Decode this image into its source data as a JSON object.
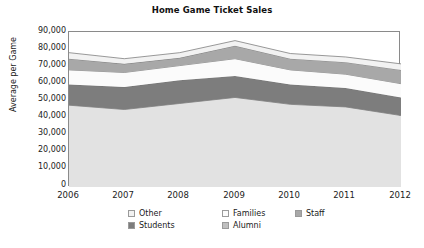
{
  "chart_data": {
    "type": "area",
    "stacked": true,
    "title": "Home Game Ticket Sales",
    "xlabel": "",
    "ylabel": "Average per Game",
    "x": [
      2006,
      2007,
      2008,
      2009,
      2010,
      2011,
      2012
    ],
    "categories": [
      "2006",
      "2007",
      "2008",
      "2009",
      "2010",
      "2011",
      "2012"
    ],
    "ylim": [
      0,
      90000
    ],
    "ytick_labels": [
      "90,000",
      "80,000",
      "70,000",
      "60,000",
      "50,000",
      "40,000",
      "30,000",
      "20,000",
      "10,000",
      "0"
    ],
    "ytick_values": [
      90000,
      80000,
      70000,
      60000,
      50000,
      40000,
      30000,
      20000,
      10000,
      0
    ],
    "grid": false,
    "legend_position": "bottom",
    "stack_order_bottom_to_top": [
      "Alumni",
      "Students",
      "Families",
      "Staff",
      "Other"
    ],
    "series": [
      {
        "name": "Alumni",
        "color": "#e2e2e2",
        "values": [
          47500,
          45000,
          48500,
          52000,
          48000,
          46500,
          41500
        ]
      },
      {
        "name": "Students",
        "color": "#7d7d7d",
        "values": [
          12000,
          13000,
          13500,
          12500,
          11500,
          11000,
          10500
        ]
      },
      {
        "name": "Families",
        "color": "#fbfbfb",
        "values": [
          8500,
          8500,
          8500,
          10000,
          8500,
          8000,
          8000
        ]
      },
      {
        "name": "Staff",
        "color": "#a8a8a8",
        "values": [
          6500,
          5000,
          4500,
          7500,
          6500,
          7000,
          8000
        ]
      },
      {
        "name": "Other",
        "color": "#f2f2f2",
        "values": [
          3500,
          3000,
          3000,
          3000,
          3000,
          3000,
          3500
        ]
      }
    ],
    "cumulative_tops": {
      "Alumni": [
        47500,
        45000,
        48500,
        52000,
        48000,
        46500,
        41500
      ],
      "Students": [
        59500,
        58000,
        62000,
        64500,
        59500,
        57500,
        52000
      ],
      "Families": [
        68000,
        66500,
        70500,
        74500,
        68000,
        65500,
        60000
      ],
      "Staff": [
        74500,
        71500,
        75000,
        82000,
        74500,
        72500,
        68000
      ],
      "Other": [
        78000,
        74500,
        78000,
        85000,
        77500,
        75500,
        71500
      ]
    }
  },
  "legend": {
    "row1": [
      {
        "label": "Other",
        "color": "#f2f2f2"
      },
      {
        "label": "Families",
        "color": "#fbfbfb"
      },
      {
        "label": "Staff",
        "color": "#a8a8a8"
      }
    ],
    "row2": [
      {
        "label": "Students",
        "color": "#7d7d7d"
      },
      {
        "label": "Alumni",
        "color": "#bfbfbf"
      }
    ]
  },
  "colors": {
    "frame": "#8a8a8a",
    "text": "#1a1a1a",
    "band_line": "#6f6f6f"
  }
}
